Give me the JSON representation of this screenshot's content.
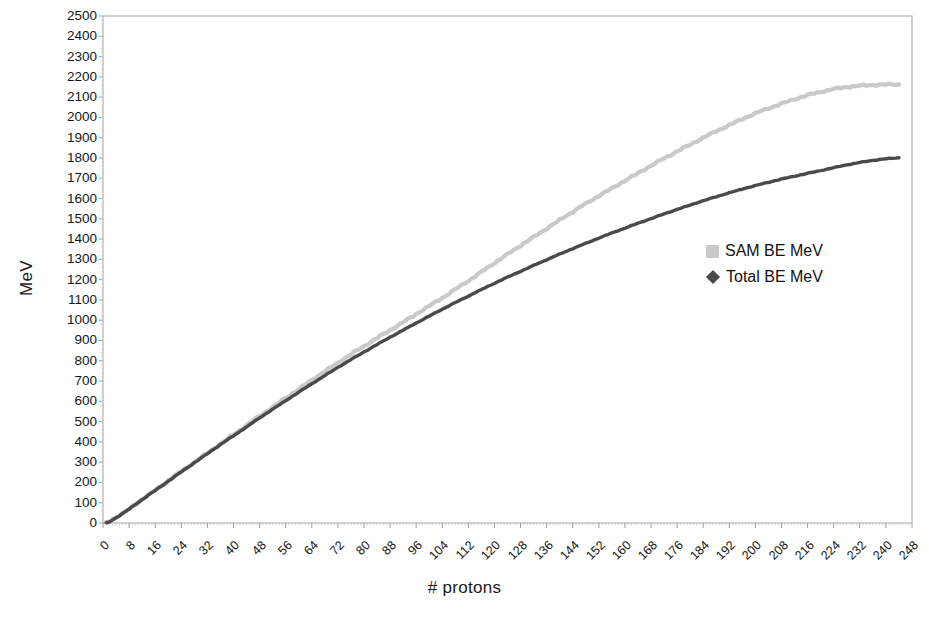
{
  "chart_data": {
    "type": "line",
    "title": "",
    "xlabel": "# protons",
    "ylabel": "MeV",
    "xlim": [
      0,
      248
    ],
    "ylim": [
      0,
      2500
    ],
    "ytick_step": 100,
    "xtick_step": 8,
    "grid": false,
    "legend_position": "inside-right",
    "xticks": [
      0,
      8,
      16,
      24,
      32,
      40,
      48,
      56,
      64,
      72,
      80,
      88,
      96,
      104,
      112,
      120,
      128,
      136,
      144,
      152,
      160,
      168,
      176,
      184,
      192,
      200,
      208,
      216,
      224,
      232,
      240,
      248
    ],
    "yticks": [
      0,
      100,
      200,
      300,
      400,
      500,
      600,
      700,
      800,
      900,
      1000,
      1100,
      1200,
      1300,
      1400,
      1500,
      1600,
      1700,
      1800,
      1900,
      2000,
      2100,
      2200,
      2300,
      2400,
      2500
    ],
    "series": [
      {
        "name": "SAM BE MeV",
        "color": "#c9c9c9",
        "marker": "square",
        "x": [
          1,
          2,
          4,
          6,
          8,
          10,
          12,
          14,
          16,
          18,
          20,
          24,
          28,
          32,
          36,
          40,
          44,
          48,
          52,
          56,
          60,
          64,
          68,
          72,
          76,
          80,
          84,
          88,
          92,
          96,
          100,
          104,
          108,
          112,
          116,
          120,
          124,
          128,
          132,
          136,
          140,
          144,
          148,
          152,
          156,
          160,
          164,
          168,
          172,
          176,
          180,
          184,
          188,
          192,
          196,
          200,
          204,
          208,
          212,
          216,
          220,
          224,
          228,
          232,
          236,
          240,
          244
        ],
        "y": [
          2,
          8,
          28,
          48,
          70,
          95,
          118,
          140,
          163,
          186,
          210,
          255,
          300,
          345,
          390,
          436,
          482,
          527,
          572,
          617,
          660,
          705,
          748,
          790,
          832,
          872,
          912,
          951,
          990,
          1030,
          1070,
          1110,
          1152,
          1194,
          1238,
          1282,
          1325,
          1368,
          1410,
          1452,
          1494,
          1535,
          1575,
          1613,
          1650,
          1688,
          1725,
          1762,
          1798,
          1832,
          1866,
          1900,
          1932,
          1962,
          1992,
          2020,
          2045,
          2068,
          2090,
          2110,
          2126,
          2140,
          2150,
          2156,
          2160,
          2162,
          2163
        ]
      },
      {
        "name": "Total BE MeV",
        "color": "#4a4a4a",
        "marker": "diamond",
        "x": [
          1,
          2,
          4,
          6,
          8,
          10,
          12,
          14,
          16,
          18,
          20,
          24,
          28,
          32,
          36,
          40,
          44,
          48,
          52,
          56,
          60,
          64,
          68,
          72,
          76,
          80,
          84,
          88,
          92,
          96,
          100,
          104,
          108,
          112,
          116,
          120,
          124,
          128,
          132,
          136,
          140,
          144,
          148,
          152,
          156,
          160,
          164,
          168,
          172,
          176,
          180,
          184,
          188,
          192,
          196,
          200,
          204,
          208,
          212,
          216,
          220,
          224,
          228,
          232,
          236,
          240,
          244
        ],
        "y": [
          0,
          7,
          26,
          46,
          68,
          92,
          115,
          138,
          160,
          183,
          206,
          252,
          297,
          342,
          387,
          430,
          474,
          518,
          561,
          603,
          645,
          686,
          727,
          767,
          806,
          843,
          880,
          916,
          951,
          986,
          1020,
          1054,
          1087,
          1119,
          1151,
          1182,
          1212,
          1241,
          1270,
          1298,
          1326,
          1353,
          1379,
          1405,
          1430,
          1454,
          1478,
          1501,
          1524,
          1546,
          1568,
          1589,
          1609,
          1628,
          1647,
          1664,
          1680,
          1696,
          1710,
          1724,
          1738,
          1752,
          1766,
          1778,
          1788,
          1796,
          1801
        ]
      }
    ]
  },
  "legend": {
    "entries": [
      {
        "label": "SAM BE MeV",
        "color": "#c9c9c9",
        "marker": "square"
      },
      {
        "label": "Total BE MeV",
        "color": "#4a4a4a",
        "marker": "diamond"
      }
    ]
  },
  "axes": {
    "y_title": "MeV",
    "x_title": "# protons"
  },
  "colors": {
    "plot_border": "#b3b3b3",
    "tick_color": "#9a9a9a",
    "text": "#161616",
    "background": "#ffffff",
    "series_light": "#c9c9c9",
    "series_dark": "#4a4a4a"
  }
}
